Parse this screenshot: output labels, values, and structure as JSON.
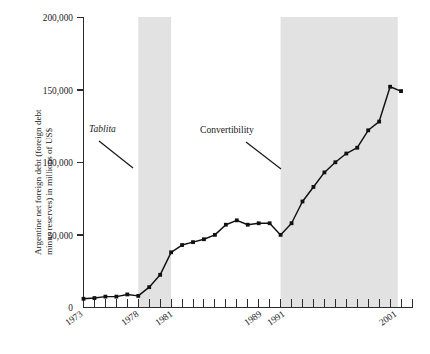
{
  "chart_data": {
    "type": "line",
    "title": "",
    "subtitle": "",
    "xlabel": "",
    "ylabel": "Argentine net foreign debt (foreign debt minus reserves) in millions of US$",
    "ylabel_line1": "Argentine net foreign debt (foreign debt",
    "ylabel_line2": "minus reserves) in millions of US$",
    "xlim": [
      1973,
      2003
    ],
    "ylim": [
      0,
      200000
    ],
    "grid": false,
    "legend": false,
    "y_ticks": [
      0,
      50000,
      100000,
      150000,
      200000
    ],
    "y_tick_labels": [
      "0",
      "50,000",
      "100,000",
      "150,000",
      "200,000"
    ],
    "x_tick_labels": [
      "1973",
      "1978",
      "1981",
      "1989",
      "1991",
      "2001"
    ],
    "x_tick_values": [
      1973,
      1978,
      1981,
      1989,
      1991,
      2001
    ],
    "x_minor_ticks_every_year": true,
    "series": [
      {
        "name": "Argentine net foreign debt",
        "x": [
          1973,
          1974,
          1975,
          1976,
          1977,
          1978,
          1979,
          1980,
          1981,
          1982,
          1983,
          1984,
          1985,
          1986,
          1987,
          1988,
          1989,
          1990,
          1991,
          1992,
          1993,
          1994,
          1995,
          1996,
          1997,
          1998,
          1999,
          2000,
          2001,
          2002
        ],
        "values": [
          6000,
          6500,
          7500,
          7500,
          9000,
          8000,
          14000,
          22500,
          38000,
          43000,
          45000,
          47000,
          50000,
          57000,
          60000,
          57000,
          58000,
          58000,
          50000,
          58000,
          73000,
          83000,
          93000,
          100000,
          106000,
          110000,
          122000,
          128000,
          152000,
          149000
        ]
      }
    ],
    "shaded_bands": [
      {
        "name": "Tablita period",
        "start": 1978,
        "end": 1981,
        "color": "#e2e2e2"
      },
      {
        "name": "Convertibility period",
        "start": 1991,
        "end": 2001.7,
        "color": "#e2e2e2"
      }
    ],
    "annotations": [
      {
        "text": "Tablita",
        "italic": true,
        "x": 1974.9,
        "y": 125000
      },
      {
        "text": "Convertibility",
        "italic": false,
        "x": 1983.5,
        "y": 124000
      }
    ]
  },
  "colors": {
    "line": "#111111",
    "band": "#e2e2e2",
    "axis": "#2b2b2b",
    "background": "#ffffff"
  }
}
